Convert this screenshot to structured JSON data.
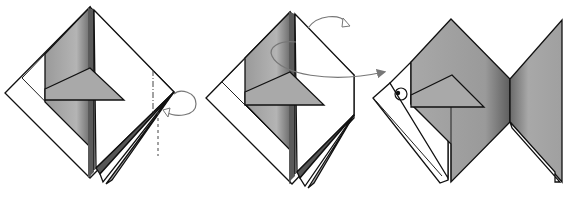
{
  "diagram": {
    "subject": "Origami fish folding steps",
    "steps": [
      {
        "index": 1,
        "label": "Step 1",
        "action": "Valley-fold along dashed line, fold flap behind",
        "symbols": [
          "valley-fold-line",
          "mountain-fold-line",
          "fold-behind-arrow"
        ]
      },
      {
        "index": 2,
        "label": "Step 2",
        "action": "Turn over and open out",
        "symbols": [
          "turn-over-arrow",
          "open-out-arrow"
        ]
      },
      {
        "index": 3,
        "label": "Step 3",
        "action": "Finished fish with eye",
        "symbols": [
          "eye-circle",
          "pointer-arrow"
        ]
      }
    ],
    "colors": {
      "paper_white": "#ffffff",
      "paper_gray_dark": "#7a7a7a",
      "paper_gray_mid": "#a6a6a6",
      "paper_gray_light": "#c8c8c8",
      "line": "#111111",
      "arrow": "#777777"
    }
  }
}
